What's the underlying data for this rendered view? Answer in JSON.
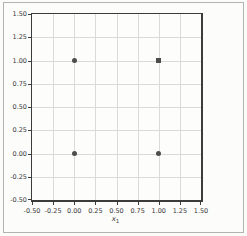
{
  "chart_data": {
    "type": "scatter",
    "title": "",
    "xlabel_letter": "x",
    "xlabel_sub": "1",
    "ylabel": "",
    "xlim": [
      -0.5,
      1.5
    ],
    "ylim": [
      -0.5,
      1.5
    ],
    "grid": true,
    "legend": "none",
    "xticks": [
      -0.5,
      -0.25,
      0,
      0.25,
      0.5,
      0.75,
      1,
      1.25,
      1.5
    ],
    "xtick_labels": [
      "-0.50",
      "-0.25",
      "0.00",
      "0.25",
      "0.50",
      "0.75",
      "1.00",
      "1.25",
      "1.50"
    ],
    "yticks": [
      -0.5,
      -0.25,
      0,
      0.25,
      0.5,
      0.75,
      1,
      1.25,
      1.5
    ],
    "ytick_labels": [
      "-0.50",
      "-0.25",
      "0.00",
      "0.25",
      "0.50",
      "0.75",
      "1.00",
      "1.25",
      "1.50"
    ],
    "points": [
      {
        "x": 0,
        "y": 0,
        "marker": "circle"
      },
      {
        "x": 0,
        "y": 1,
        "marker": "circle"
      },
      {
        "x": 1,
        "y": 0,
        "marker": "circle"
      },
      {
        "x": 1,
        "y": 1,
        "marker": "square"
      }
    ],
    "colors": {
      "marker": "#4d4d4d",
      "grid": "#dadad7",
      "spine": "#3c3c3c",
      "tick_text": "#3a3a3a",
      "panel_border": "#b3b3b0",
      "background": "#fbfbf9"
    }
  }
}
